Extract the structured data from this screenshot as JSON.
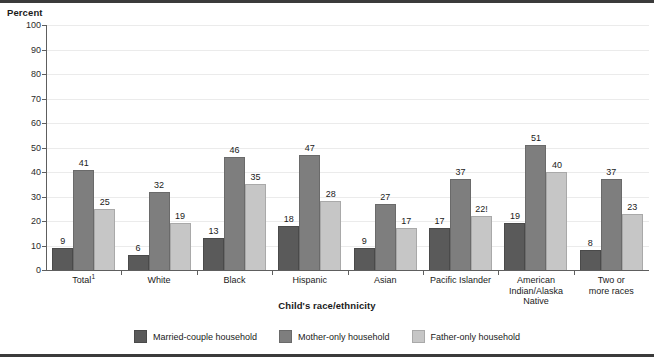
{
  "chart_data": {
    "type": "bar",
    "title": "",
    "xlabel": "Child's race/ethnicity",
    "ylabel": "Percent",
    "ylim": [
      0,
      100
    ],
    "yticks": [
      0,
      10,
      20,
      30,
      40,
      50,
      60,
      70,
      80,
      90,
      100
    ],
    "grid": true,
    "legend_position": "bottom",
    "categories": [
      "Total¹",
      "White",
      "Black",
      "Hispanic",
      "Asian",
      "Pacific Islander",
      "American\nIndian/Alaska\nNative",
      "Two or\nmore races"
    ],
    "series": [
      {
        "name": "Married-couple household",
        "color": "#5a5a5a",
        "values": [
          9,
          6,
          13,
          18,
          9,
          17,
          19,
          8
        ],
        "labels": [
          "9",
          "6",
          "13",
          "18",
          "9",
          "17",
          "19",
          "8"
        ]
      },
      {
        "name": "Mother-only household",
        "color": "#7e7e7e",
        "values": [
          41,
          32,
          46,
          47,
          27,
          37,
          51,
          37
        ],
        "labels": [
          "41",
          "32",
          "46",
          "47",
          "27",
          "37",
          "51",
          "37"
        ]
      },
      {
        "name": "Father-only household",
        "color": "#c6c6c6",
        "values": [
          25,
          19,
          35,
          28,
          17,
          22,
          40,
          23
        ],
        "labels": [
          "25",
          "19",
          "35",
          "28",
          "17",
          "22!",
          "40",
          "23"
        ]
      }
    ]
  },
  "axis": {
    "y_unit_title": "Percent"
  },
  "colors": {
    "series_married": "#5a5a5a",
    "series_mother": "#7e7e7e",
    "series_father": "#c6c6c6",
    "axis": "#5e5e5e",
    "gridline": "#ebebeb",
    "frame_rule": "#3b3b3b"
  }
}
